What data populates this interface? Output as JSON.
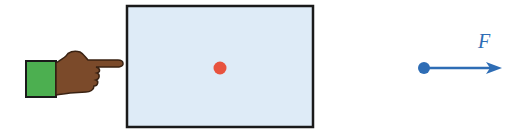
{
  "diagram": {
    "hand": {
      "sleeve_color": "#4caf50",
      "skin_color": "#7b4a2a"
    },
    "block": {
      "fill": "#deebf7",
      "stroke": "#1a1a1a"
    },
    "center_dot": {
      "color": "#e8533f"
    },
    "force": {
      "label": "F",
      "color": "#2e6db5",
      "direction": "right"
    }
  }
}
